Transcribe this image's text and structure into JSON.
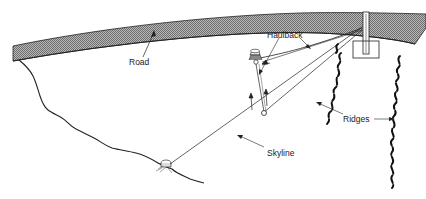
{
  "diagram": {
    "type": "skyline logging system illustration",
    "labels": {
      "road": "Road",
      "haulback": "Haulback",
      "skyline": "Skyline",
      "ridges": "Ridges"
    },
    "elements": [
      "road",
      "spar tower",
      "carriage",
      "tail-hold stump",
      "intermediate stump",
      "slope profile",
      "ridges"
    ],
    "colors": {
      "line": "#222222",
      "road_fill": "#9a9a9a",
      "background": "#ffffff"
    }
  }
}
